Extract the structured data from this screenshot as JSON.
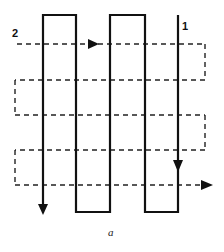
{
  "figure": {
    "caption": "a",
    "path_1_label": "1",
    "path_2_label": "2",
    "colors": {
      "stroke": "#111111",
      "background": "#ffffff"
    }
  },
  "path_1": {
    "style": "solid",
    "description": "serpentine vertical path",
    "columns_x": [
      43,
      76,
      110,
      145,
      178
    ],
    "top_y": 15,
    "bottom_y": 212
  },
  "path_2": {
    "style": "dashed",
    "description": "serpentine horizontal path",
    "rows_y": [
      44,
      80,
      115,
      150,
      185
    ],
    "left_x": 15,
    "right_x": 205
  }
}
